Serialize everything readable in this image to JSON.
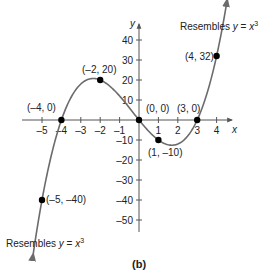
{
  "chart_data": {
    "type": "line",
    "title": "",
    "caption": "(b)",
    "function": "f(x) = x(x+4)(x-3) = x^3 + x^2 - 12x",
    "xlabel": "x",
    "ylabel": "y",
    "xlim": [
      -5.5,
      4.8
    ],
    "ylim": [
      -60,
      47
    ],
    "x_ticks": [
      -5,
      -4,
      -3,
      -2,
      -1,
      1,
      2,
      3,
      4
    ],
    "y_ticks": [
      -50,
      -40,
      -30,
      -20,
      -10,
      10,
      20,
      30,
      40
    ],
    "x_tick_labels": [
      "–5",
      "–4",
      "–3",
      "–2",
      "–1",
      "1",
      "2",
      "3",
      "4"
    ],
    "y_tick_labels": [
      "–50",
      "–40",
      "–30",
      "–20",
      "–10",
      "10",
      "20",
      "30",
      "40"
    ],
    "grid": false,
    "points": [
      {
        "x": -5,
        "y": -40,
        "label": "(–5, –40)"
      },
      {
        "x": -4,
        "y": 0,
        "label": "(–4, 0)"
      },
      {
        "x": -2,
        "y": 20,
        "label": "(–2, 20)"
      },
      {
        "x": 0,
        "y": 0,
        "label": "(0, 0)"
      },
      {
        "x": 1,
        "y": -10,
        "label": "(1, –10)"
      },
      {
        "x": 3,
        "y": 0,
        "label": "(3, 0)"
      },
      {
        "x": 4,
        "y": 32,
        "label": "(4, 32)"
      }
    ],
    "annotations": [
      {
        "text": "Resembles y = x³",
        "position": "top-right"
      },
      {
        "text": "Resembles y = x³",
        "position": "bottom-left"
      }
    ]
  },
  "labels": {
    "annot_prefix": "Resembles ",
    "annot_y": "y",
    "annot_eq": " = ",
    "annot_x": "x",
    "annot_exp": "3",
    "x_axis": "x",
    "y_axis": "y",
    "caption": "(b)",
    "p_m5": "(–5, –40)",
    "p_m4": "(–4, 0)",
    "p_m2": "(–2, 20)",
    "p_0": "(0, 0)",
    "p_1": "(1, –10)",
    "p_3": "(3, 0)",
    "p_4": "(4, 32)"
  },
  "colors": {
    "curve": "#6b6b6b",
    "axis": "#555555",
    "point": "#000000"
  }
}
